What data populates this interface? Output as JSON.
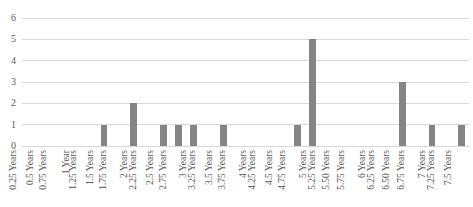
{
  "chart_data": {
    "type": "bar",
    "title": "",
    "subtitle": "",
    "xlabel": "",
    "ylabel": "",
    "ylim": [
      0,
      6
    ],
    "yticks": [
      0,
      1,
      2,
      3,
      4,
      5,
      6
    ],
    "grid": true,
    "legend": false,
    "legend_position": "none",
    "bar_color": "#858585",
    "gridline_color": "#d9d9d9",
    "text_color": "#595959",
    "background_color": "#ffffff",
    "categories": [
      "0.25 Years",
      "0.5 Years",
      "0.75 Years",
      "1 Year",
      "1.25 Years",
      "1.5 Years",
      "1.75 Years",
      "2 Years",
      "2.25 Years",
      "2.5 Years",
      "2.75 Years",
      "3 Years",
      "3.25 Years",
      "3.5 Years",
      "3.75 Years",
      "4 Years",
      "4.25 Years",
      "4.5 Years",
      "4.75 Years",
      "5 Years",
      "5.25 Years",
      "5.50 Years",
      "5.75 Years",
      "6 Years",
      "6.25 Years",
      "6.50 Years",
      "6.75 Years",
      "7 Years",
      "7.25 Years",
      "7.5 Years"
    ],
    "values": [
      0,
      0,
      0,
      0,
      0,
      1,
      0,
      2,
      0,
      1,
      1,
      1,
      0,
      1,
      0,
      0,
      0,
      0,
      1,
      5,
      0,
      0,
      0,
      0,
      0,
      3,
      0,
      1,
      0,
      1
    ]
  }
}
